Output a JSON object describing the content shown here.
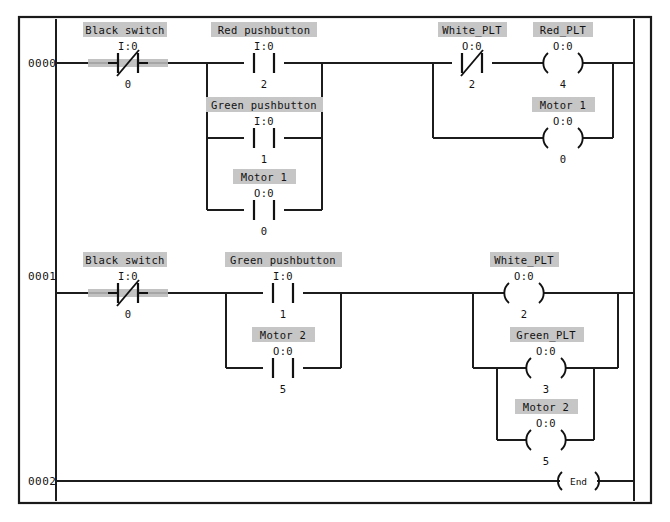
{
  "document": {
    "type": "ladder-logic-diagram",
    "title": "Ladder Logic Program",
    "frame_color": "#1a1a1a",
    "wire_color": "#1c1c1c",
    "label_box_color": "#c6c6c6",
    "highlight_bar_color": "#b9b9b9",
    "background_color": "#ffffff"
  },
  "rungs": [
    {
      "number": "0000",
      "elements": [
        {
          "id": "r0-black-switch",
          "kind": "contact-nc",
          "name": "Black switch",
          "address": "I:0",
          "bit": "0",
          "highlighted": true,
          "x": 128,
          "y": 63
        },
        {
          "id": "r0-red-pushbutton",
          "kind": "contact-no",
          "name": "Red pushbutton",
          "address": "I:0",
          "bit": "2",
          "highlighted": false,
          "x": 264,
          "y": 63
        },
        {
          "id": "r0-green-pushbutton",
          "kind": "contact-no",
          "name": "Green pushbutton",
          "address": "I:0",
          "bit": "1",
          "highlighted": false,
          "x": 264,
          "y": 138
        },
        {
          "id": "r0-motor1-contact",
          "kind": "contact-no",
          "name": "Motor 1",
          "address": "O:0",
          "bit": "0",
          "highlighted": false,
          "x": 264,
          "y": 210
        },
        {
          "id": "r0-white-plt",
          "kind": "contact-nc",
          "name": "White_PLT",
          "address": "O:0",
          "bit": "2",
          "highlighted": false,
          "x": 472,
          "y": 63
        },
        {
          "id": "r0-red-plt",
          "kind": "coil",
          "name": "Red_PLT",
          "address": "O:0",
          "bit": "4",
          "highlighted": false,
          "x": 563,
          "y": 63
        },
        {
          "id": "r0-motor1-coil",
          "kind": "coil",
          "name": "Motor 1",
          "address": "O:0",
          "bit": "0",
          "highlighted": false,
          "x": 563,
          "y": 138
        }
      ]
    },
    {
      "number": "0001",
      "elements": [
        {
          "id": "r1-black-switch",
          "kind": "contact-nc",
          "name": "Black switch",
          "address": "I:0",
          "bit": "0",
          "highlighted": true,
          "x": 128,
          "y": 293
        },
        {
          "id": "r1-green-pushbutton",
          "kind": "contact-no",
          "name": "Green pushbutton",
          "address": "I:0",
          "bit": "1",
          "highlighted": false,
          "x": 283,
          "y": 293
        },
        {
          "id": "r1-motor2-contact",
          "kind": "contact-no",
          "name": "Motor 2",
          "address": "O:0",
          "bit": "5",
          "highlighted": false,
          "x": 283,
          "y": 368
        },
        {
          "id": "r1-white-plt",
          "kind": "coil",
          "name": "White_PLT",
          "address": "O:0",
          "bit": "2",
          "highlighted": false,
          "x": 524,
          "y": 293
        },
        {
          "id": "r1-green-plt",
          "kind": "coil",
          "name": "Green_PLT",
          "address": "O:0",
          "bit": "3",
          "highlighted": false,
          "x": 546,
          "y": 368
        },
        {
          "id": "r1-motor2-coil",
          "kind": "coil",
          "name": "Motor 2",
          "address": "O:0",
          "bit": "5",
          "highlighted": false,
          "x": 546,
          "y": 440
        }
      ]
    },
    {
      "number": "0002",
      "elements": [
        {
          "id": "r2-end",
          "kind": "end-coil",
          "name": "End",
          "address": "",
          "bit": "",
          "highlighted": false,
          "x": 578,
          "y": 481
        }
      ]
    }
  ]
}
